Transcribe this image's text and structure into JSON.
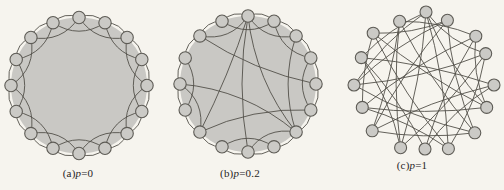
{
  "figure": {
    "style": {
      "background": "#f6f4ee",
      "disk_fill": "#c9c8c4",
      "node_fill": "#cbcac6",
      "node_stroke": "#5d5b55",
      "edge_stroke": "#52504a",
      "edge_width": 0.9
    },
    "panels": [
      {
        "id": "a",
        "label": {
          "prefix": "(a)",
          "var": "p",
          "value": "=0"
        },
        "type": "ring-lattice",
        "node_count": 16,
        "cx": 79,
        "cy": 85.5,
        "r": 68,
        "node_r": 6.2,
        "disk": true,
        "label_x": 78,
        "label_y": 167,
        "edges": [
          [
            0,
            1,
            9
          ],
          [
            1,
            2,
            9
          ],
          [
            2,
            3,
            9
          ],
          [
            3,
            4,
            9
          ],
          [
            4,
            5,
            9
          ],
          [
            5,
            6,
            9
          ],
          [
            6,
            7,
            9
          ],
          [
            7,
            8,
            9
          ],
          [
            8,
            9,
            9
          ],
          [
            9,
            10,
            9
          ],
          [
            10,
            11,
            9
          ],
          [
            11,
            12,
            9
          ],
          [
            12,
            13,
            9
          ],
          [
            13,
            14,
            9
          ],
          [
            14,
            15,
            9
          ],
          [
            15,
            0,
            9
          ],
          [
            0,
            2,
            -17
          ],
          [
            1,
            3,
            -17
          ],
          [
            2,
            4,
            -17
          ],
          [
            3,
            5,
            -17
          ],
          [
            4,
            6,
            -17
          ],
          [
            5,
            7,
            -17
          ],
          [
            6,
            8,
            -17
          ],
          [
            7,
            9,
            -17
          ],
          [
            8,
            10,
            -17
          ],
          [
            9,
            11,
            -17
          ],
          [
            10,
            12,
            -17
          ],
          [
            11,
            13,
            -17
          ],
          [
            12,
            14,
            -17
          ],
          [
            13,
            15,
            -17
          ],
          [
            14,
            0,
            -17
          ],
          [
            15,
            1,
            -17
          ]
        ]
      },
      {
        "id": "b",
        "label": {
          "prefix": "(b)",
          "var": "p",
          "value": "=0.2"
        },
        "type": "partially-rewired",
        "node_count": 16,
        "cx": 248,
        "cy": 84,
        "r": 68,
        "node_r": 6.2,
        "disk": true,
        "label_x": 240,
        "label_y": 167,
        "edges": [
          [
            0,
            1,
            9
          ],
          [
            1,
            2,
            9
          ],
          [
            2,
            3,
            9
          ],
          [
            3,
            4,
            9
          ],
          [
            4,
            5,
            9
          ],
          [
            5,
            6,
            9
          ],
          [
            6,
            7,
            9
          ],
          [
            7,
            8,
            9
          ],
          [
            8,
            9,
            9
          ],
          [
            9,
            10,
            9
          ],
          [
            10,
            11,
            9
          ],
          [
            11,
            12,
            9
          ],
          [
            12,
            13,
            9
          ],
          [
            13,
            14,
            9
          ],
          [
            14,
            15,
            9
          ],
          [
            15,
            0,
            9
          ],
          [
            0,
            2,
            -17
          ],
          [
            1,
            3,
            -17
          ],
          [
            3,
            5,
            -17
          ],
          [
            6,
            8,
            -17
          ],
          [
            7,
            9,
            -17
          ],
          [
            10,
            12,
            -17
          ],
          [
            11,
            13,
            -17
          ],
          [
            14,
            0,
            -17
          ],
          [
            15,
            1,
            -17
          ],
          [
            0,
            10,
            -5
          ],
          [
            0,
            6,
            -18
          ],
          [
            0,
            8,
            12
          ],
          [
            14,
            4,
            -12
          ],
          [
            12,
            6,
            -20
          ],
          [
            10,
            5,
            -14
          ],
          [
            2,
            6,
            -16
          ]
        ]
      },
      {
        "id": "c",
        "label": {
          "prefix": "(c)",
          "var": "p",
          "value": "=1"
        },
        "type": "random",
        "node_count": 16,
        "cx": 424,
        "cy": 83,
        "r": 69,
        "node_r": 6,
        "disk": false,
        "label_x": 412,
        "label_y": 159,
        "jitter": [
          [
            2,
            -2
          ],
          [
            -3,
            1
          ],
          [
            3,
            2
          ],
          [
            -2,
            -3
          ],
          [
            1,
            2
          ],
          [
            -1,
            -2
          ],
          [
            2,
            1
          ],
          [
            -2,
            2
          ],
          [
            1,
            -3
          ],
          [
            3,
            1
          ],
          [
            -3,
            -1
          ],
          [
            2,
            -2
          ],
          [
            -1,
            2
          ],
          [
            1,
            1
          ],
          [
            -2,
            -1
          ],
          [
            2,
            2
          ]
        ],
        "edges": [
          [
            0,
            5,
            -10
          ],
          [
            0,
            7,
            8
          ],
          [
            0,
            9,
            -8
          ],
          [
            0,
            12,
            10
          ],
          [
            0,
            3,
            -12
          ],
          [
            0,
            13,
            8
          ],
          [
            1,
            6,
            -10
          ],
          [
            1,
            10,
            8
          ],
          [
            1,
            14,
            -8
          ],
          [
            1,
            12,
            10
          ],
          [
            2,
            8,
            -8
          ],
          [
            2,
            11,
            10
          ],
          [
            2,
            5,
            -10
          ],
          [
            2,
            15,
            8
          ],
          [
            3,
            9,
            8
          ],
          [
            3,
            12,
            -10
          ],
          [
            3,
            7,
            10
          ],
          [
            4,
            10,
            -8
          ],
          [
            4,
            13,
            8
          ],
          [
            4,
            8,
            -10
          ],
          [
            5,
            11,
            8
          ],
          [
            5,
            14,
            -8
          ],
          [
            6,
            12,
            10
          ],
          [
            6,
            15,
            -8
          ],
          [
            6,
            10,
            8
          ],
          [
            7,
            11,
            -8
          ],
          [
            7,
            14,
            8
          ],
          [
            8,
            13,
            -8
          ],
          [
            9,
            15,
            8
          ],
          [
            9,
            13,
            -10
          ],
          [
            10,
            15,
            -6
          ],
          [
            11,
            14,
            6
          ]
        ]
      }
    ]
  }
}
